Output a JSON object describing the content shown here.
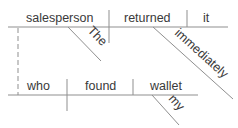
{
  "diagram": {
    "type": "sentence-diagram",
    "style": "Reed-Kellogg",
    "main_clause": {
      "subject": "salesperson",
      "verb": "returned",
      "direct_object": "it",
      "subject_modifiers": [
        "The"
      ],
      "verb_modifiers": [
        "immediately"
      ]
    },
    "relative_clause": {
      "subject": "who",
      "verb": "found",
      "direct_object": "wallet",
      "object_modifiers": [
        "my"
      ]
    },
    "connector": "dashed line linking 'salesperson' to relative pronoun 'who'",
    "colors": {
      "line": "#8f8f8f",
      "text": "#3a3a3a"
    }
  }
}
